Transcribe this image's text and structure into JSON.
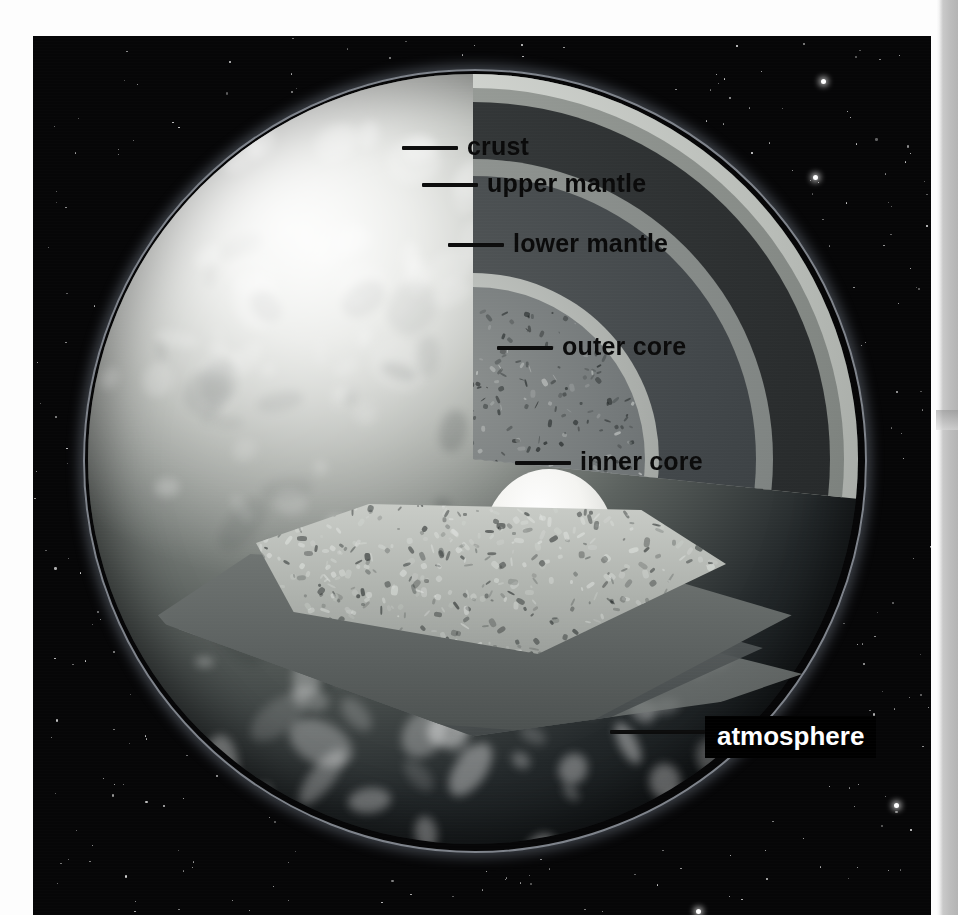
{
  "figure": {
    "background_color": "#060607",
    "page_color": "#ffffff"
  },
  "labels": [
    {
      "id": "crust",
      "text": "crust",
      "style": "dark-on-light"
    },
    {
      "id": "upper_mantle",
      "text": "upper mantle",
      "style": "dark-on-light"
    },
    {
      "id": "lower_mantle",
      "text": "lower mantle",
      "style": "dark-on-light"
    },
    {
      "id": "outer_core",
      "text": "outer core",
      "style": "dark-on-light"
    },
    {
      "id": "inner_core",
      "text": "inner core",
      "style": "dark-on-light"
    },
    {
      "id": "atmosphere",
      "text": "atmosphere",
      "style": "white-on-black-box"
    }
  ],
  "layers": [
    {
      "name": "atmosphere",
      "color": "#e1ebf8"
    },
    {
      "name": "crust",
      "color": "#b9bdb8"
    },
    {
      "name": "upper mantle",
      "color": "#2a2d2e"
    },
    {
      "name": "lower mantle",
      "color": "#42474a"
    },
    {
      "name": "outer core",
      "color": "#74797a"
    },
    {
      "name": "inner core",
      "color": "#f4f4f1"
    }
  ]
}
